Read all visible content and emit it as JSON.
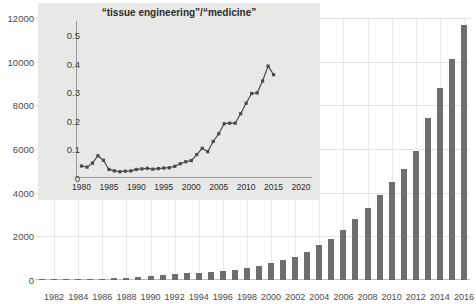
{
  "chart_data": [
    {
      "id": "main",
      "type": "bar",
      "title": "",
      "xlabel": "",
      "ylabel": "",
      "ylim": [
        0,
        12000
      ],
      "yticks": [
        0,
        2000,
        4000,
        6000,
        8000,
        10000,
        12000
      ],
      "ytick_labels": [
        "0",
        "2000",
        "4000",
        "6000",
        "8000",
        "10000",
        "12000"
      ],
      "xtick_labels": [
        "1982",
        "1984",
        "1986",
        "1988",
        "1990",
        "1992",
        "1994",
        "1996",
        "1998",
        "2000",
        "2002",
        "2004",
        "2006",
        "2008",
        "2010",
        "2012",
        "2014",
        "2016"
      ],
      "grid": true,
      "legend": "none",
      "bar_color": "#6e6e6e",
      "categories": [
        1981,
        1982,
        1983,
        1984,
        1985,
        1986,
        1987,
        1988,
        1989,
        1990,
        1991,
        1992,
        1993,
        1994,
        1995,
        1996,
        1997,
        1998,
        1999,
        2000,
        2001,
        2002,
        2003,
        2004,
        2005,
        2006,
        2007,
        2008,
        2009,
        2010,
        2011,
        2012,
        2013,
        2014,
        2015,
        2016
      ],
      "values": [
        10,
        15,
        20,
        30,
        45,
        60,
        80,
        110,
        150,
        200,
        230,
        260,
        300,
        340,
        390,
        430,
        480,
        560,
        640,
        760,
        900,
        1050,
        1300,
        1600,
        1900,
        2300,
        2800,
        3300,
        3900,
        4500,
        5100,
        5900,
        7400,
        8800,
        10100,
        11700
      ]
    },
    {
      "id": "inset",
      "type": "line",
      "title": "“tissue engineering”/“medicine”",
      "xlabel": "",
      "ylabel": "",
      "ylim": [
        0,
        0.55
      ],
      "xlim": [
        1979,
        2022
      ],
      "yticks": [
        0,
        0.1,
        0.2,
        0.3,
        0.4,
        0.5
      ],
      "ytick_labels": [
        "0",
        "0.1",
        "0.2",
        "0.3",
        "0.4",
        "0.5"
      ],
      "xticks": [
        1980,
        1985,
        1990,
        1995,
        2000,
        2005,
        2010,
        2015,
        2020
      ],
      "xtick_labels": [
        "1980",
        "1985",
        "1990",
        "1995",
        "2000",
        "2005",
        "2010",
        "2015",
        "2020"
      ],
      "grid": false,
      "legend": "none",
      "line_color": "#4a4a4a",
      "marker": "square",
      "x": [
        1980,
        1981,
        1982,
        1983,
        1984,
        1985,
        1986,
        1987,
        1988,
        1989,
        1990,
        1991,
        1992,
        1993,
        1994,
        1995,
        1996,
        1997,
        1998,
        1999,
        2000,
        2001,
        2002,
        2003,
        2004,
        2005,
        2006,
        2007,
        2008,
        2009,
        2010,
        2011,
        2012,
        2013,
        2014,
        2015
      ],
      "y": [
        0.042,
        0.038,
        0.052,
        0.078,
        0.062,
        0.03,
        0.025,
        0.022,
        0.024,
        0.025,
        0.03,
        0.032,
        0.034,
        0.031,
        0.033,
        0.035,
        0.036,
        0.041,
        0.05,
        0.057,
        0.061,
        0.082,
        0.104,
        0.092,
        0.128,
        0.155,
        0.19,
        0.192,
        0.192,
        0.225,
        0.262,
        0.296,
        0.298,
        0.34,
        0.392,
        0.362
      ]
    }
  ]
}
